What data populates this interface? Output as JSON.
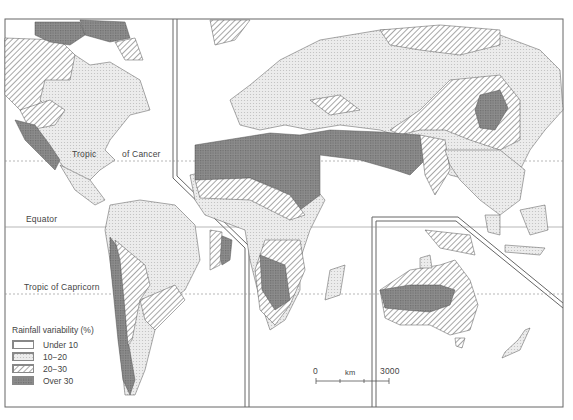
{
  "map": {
    "title": "Rainfall variability (%)",
    "lines": {
      "tropic_cancer": "Tropic of Cancer",
      "tropic_cancer_part1": "Tropic",
      "tropic_cancer_part2": "of Cancer",
      "equator": "Equator",
      "tropic_capricorn": "Tropic of Capricorn"
    },
    "legend": {
      "title": "Rainfall variability (%)",
      "items": [
        {
          "label": "Under 10",
          "pattern": "blank",
          "color": "#ffffff"
        },
        {
          "label": "10−20",
          "pattern": "dotted",
          "color": "#e2e2e2"
        },
        {
          "label": "20−30",
          "pattern": "hatched",
          "color": "#9a9a9a"
        },
        {
          "label": "Over 30",
          "pattern": "crosshatch",
          "color": "#777777"
        }
      ]
    },
    "scale": {
      "start": "0",
      "unit": "km",
      "end": "3000"
    }
  },
  "colors": {
    "light_stipple": "#e4e4e4",
    "hatch_line": "#7a7a7a",
    "dark": "#8a8a8a",
    "outline": "#555555",
    "frame": "#666666"
  }
}
